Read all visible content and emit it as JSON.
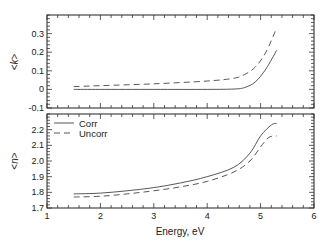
{
  "chart_data": [
    {
      "type": "line",
      "panel": "top",
      "title": "",
      "xlabel": "",
      "ylabel": "<k>",
      "xlim": [
        1,
        6
      ],
      "ylim": [
        -0.1,
        0.4
      ],
      "xticks": [
        1,
        2,
        3,
        4,
        5,
        6
      ],
      "yticks": [
        -0.1,
        0,
        0.1,
        0.2,
        0.3
      ],
      "ytick_labels": [
        "-0.1",
        "0",
        "0.1",
        "0.2",
        "0.3"
      ],
      "grid": false,
      "series": [
        {
          "name": "Corr",
          "style": "solid",
          "x": [
            1.5,
            2.0,
            3.0,
            4.0,
            4.5,
            4.7,
            4.9,
            5.1,
            5.3
          ],
          "y": [
            0.0,
            0.0,
            0.0,
            0.0,
            0.002,
            0.01,
            0.04,
            0.11,
            0.21
          ]
        },
        {
          "name": "Uncorr",
          "style": "dashed",
          "x": [
            1.5,
            2.0,
            3.0,
            4.0,
            4.5,
            4.7,
            4.9,
            5.1,
            5.3
          ],
          "y": [
            0.015,
            0.02,
            0.03,
            0.045,
            0.06,
            0.08,
            0.12,
            0.2,
            0.33
          ]
        }
      ]
    },
    {
      "type": "line",
      "panel": "bottom",
      "title": "",
      "xlabel": "Energy,  eV",
      "ylabel": "<n>",
      "xlim": [
        1,
        6
      ],
      "ylim": [
        1.7,
        2.3
      ],
      "xticks": [
        1,
        2,
        3,
        4,
        5,
        6
      ],
      "xtick_labels": [
        "1",
        "2",
        "3",
        "4",
        "5",
        "6"
      ],
      "yticks": [
        1.7,
        1.8,
        1.9,
        2.0,
        2.1,
        2.2
      ],
      "ytick_labels": [
        "1.7",
        "1.8",
        "1.9",
        "2.0",
        "2.1",
        "2.2"
      ],
      "grid": false,
      "legend": {
        "placement": "top-left",
        "entries": [
          {
            "label": "Corr",
            "style": "solid"
          },
          {
            "label": "Uncorr",
            "style": "dashed"
          }
        ]
      },
      "series": [
        {
          "name": "Corr",
          "style": "solid",
          "x": [
            1.5,
            2.0,
            2.5,
            3.0,
            3.5,
            4.0,
            4.5,
            4.8,
            5.0,
            5.2,
            5.3
          ],
          "y": [
            1.79,
            1.795,
            1.81,
            1.83,
            1.86,
            1.9,
            1.96,
            2.05,
            2.16,
            2.23,
            2.24
          ]
        },
        {
          "name": "Uncorr",
          "style": "dashed",
          "x": [
            1.5,
            2.0,
            2.5,
            3.0,
            3.5,
            4.0,
            4.5,
            4.8,
            5.0,
            5.15,
            5.3
          ],
          "y": [
            1.77,
            1.775,
            1.79,
            1.81,
            1.835,
            1.87,
            1.93,
            2.0,
            2.09,
            2.15,
            2.16
          ]
        }
      ]
    }
  ]
}
